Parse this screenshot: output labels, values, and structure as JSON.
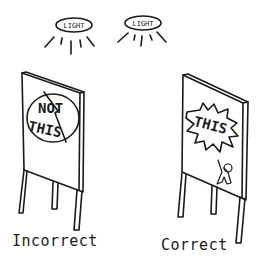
{
  "lights": [
    {
      "label": "LIGHT"
    },
    {
      "label": "LIGHT"
    }
  ],
  "signs": {
    "incorrect": {
      "text_line1": "NOT",
      "text_line2": "THIS",
      "caption": "Incorrect"
    },
    "correct": {
      "text": "THIS",
      "caption": "Correct"
    }
  },
  "colors": {
    "ink": "#1a1a1a",
    "background": "#ffffff"
  }
}
